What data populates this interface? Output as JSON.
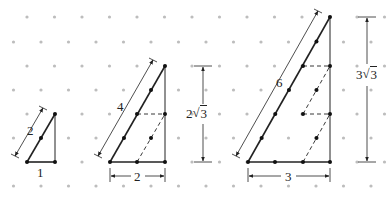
{
  "figure": {
    "colors": {
      "grid_dot": "#bdbdbd",
      "line": "#222222",
      "vertex": "#111111"
    },
    "grid": {
      "dx": 27.5,
      "dy": 24.2,
      "rows_y": [
        17,
        42,
        66,
        90,
        114,
        138,
        162,
        186
      ]
    },
    "triangles": [
      {
        "id": "small",
        "scale": 1,
        "labels": {
          "hypotenuse": "2",
          "base": "1",
          "height": "√3"
        }
      },
      {
        "id": "medium",
        "scale": 2,
        "labels": {
          "hypotenuse": "4",
          "base": "2",
          "height_segments": [
            "√3",
            "√3"
          ],
          "total_height": "2√3"
        }
      },
      {
        "id": "large",
        "scale": 3,
        "labels": {
          "hypotenuse": "6",
          "base": "3",
          "height_segments": [
            "√3",
            "√3",
            "√3"
          ],
          "total_height": "3√3"
        }
      }
    ]
  },
  "labels": {
    "small_hyp": "2",
    "small_base": "1",
    "small_height_coef": "",
    "small_height_rad": "3",
    "med_hyp": "4",
    "med_base": "2",
    "med_seg_rad": "3",
    "med_total_coef": "2",
    "med_total_rad": "3",
    "large_hyp": "6",
    "large_base": "3",
    "large_seg_rad": "3",
    "large_total_coef": "3",
    "large_total_rad": "3",
    "radical_sign": "√"
  }
}
